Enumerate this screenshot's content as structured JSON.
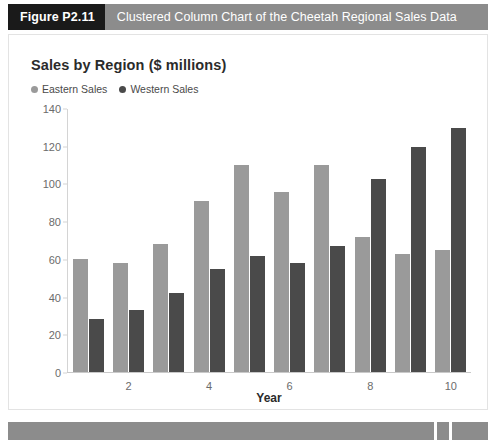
{
  "figure": {
    "tag": "Figure P2.11",
    "caption": "Clustered Column Chart of the Cheetah Regional Sales Data"
  },
  "chart_data": {
    "type": "bar",
    "title": "Sales by Region ($ millions)",
    "xlabel": "Year",
    "ylabel": "",
    "categories": [
      "1",
      "2",
      "3",
      "4",
      "5",
      "6",
      "7",
      "8",
      "9",
      "10"
    ],
    "xtick_labels": [
      "",
      "2",
      "",
      "4",
      "",
      "6",
      "",
      "8",
      "",
      "10"
    ],
    "ytick_labels": [
      "0",
      "20",
      "40",
      "60",
      "80",
      "100",
      "120",
      "140"
    ],
    "yticks": [
      0,
      20,
      40,
      60,
      80,
      100,
      120,
      140
    ],
    "ylim": [
      0,
      140
    ],
    "grid": false,
    "legend_position": "top-left",
    "series": [
      {
        "name": "Eastern Sales",
        "color": "#9a9a9a",
        "values": [
          60,
          58,
          68,
          91,
          110,
          96,
          110,
          72,
          63,
          65
        ]
      },
      {
        "name": "Western Sales",
        "color": "#4a4a4a",
        "values": [
          28,
          33,
          42,
          55,
          62,
          58,
          67,
          103,
          120,
          130
        ]
      }
    ]
  },
  "colors": {
    "banner": "#8c8c8c",
    "tag_background": "#1a1a1a",
    "axis": "#d4d4d4",
    "text": "#2b2b2b"
  }
}
